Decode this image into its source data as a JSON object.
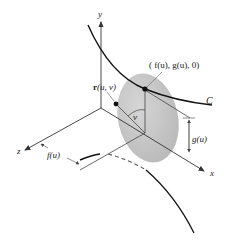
{
  "figure": {
    "labels": {
      "y_axis": "y",
      "x_axis": "x",
      "z_axis": "z",
      "curve": "C",
      "point_on_curve": "( f(u), g(u), 0)",
      "surface_point": "r(u, v)",
      "surface_point_bold": "r",
      "surface_point_args": "(u, v)",
      "angle": "v",
      "height_dim": "g(u)",
      "depth_dim": "f(u)"
    },
    "colors": {
      "disk_fill": "#c8c8c8",
      "line": "#222222",
      "axis": "#333333"
    }
  }
}
